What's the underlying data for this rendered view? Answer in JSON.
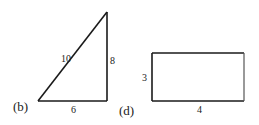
{
  "figures": [
    {
      "id": "b",
      "part_label": "(b)",
      "shape": "right-triangle",
      "sides": {
        "hypotenuse": "10",
        "vertical_leg": "8",
        "horizontal_leg": "6"
      }
    },
    {
      "id": "d",
      "part_label": "(d)",
      "shape": "rectangle",
      "sides": {
        "height": "3",
        "width": "4"
      }
    }
  ]
}
